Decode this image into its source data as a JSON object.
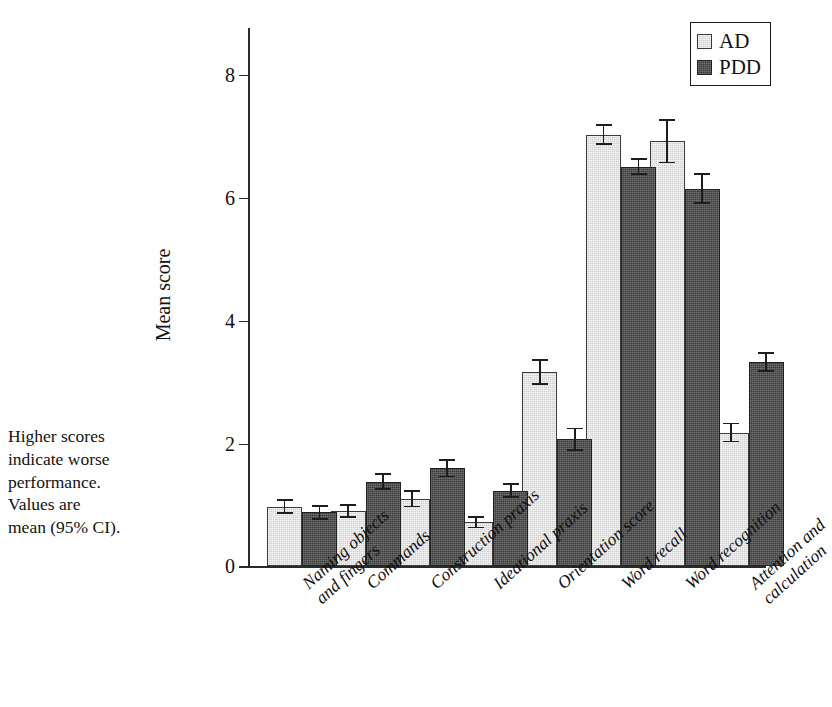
{
  "caption": {
    "lines": [
      "Higher scores",
      "indicate worse",
      "performance.",
      "Values are",
      "mean (95% CI)."
    ]
  },
  "legend": {
    "position": "top-right",
    "entries": [
      {
        "label": "AD",
        "color": "#cfcfcf"
      },
      {
        "label": "PDD",
        "color": "#3b3b3b"
      }
    ]
  },
  "axes": {
    "ylabel": "Mean score",
    "yticks": [
      "0",
      "2",
      "4",
      "6",
      "8"
    ]
  },
  "chart_data": {
    "type": "bar",
    "title": "",
    "xlabel": "",
    "ylabel": "Mean score",
    "ylim": [
      0,
      8.3
    ],
    "yticks": [
      0,
      2,
      4,
      6,
      8
    ],
    "grid": false,
    "legend_position": "top-right",
    "categories": [
      "Naming objects and fingers",
      "Commands",
      "Construction praxis",
      "Ideational praxis",
      "Orientation score",
      "Word recall",
      "Word recognition",
      "Attention and calculation"
    ],
    "category_lines": [
      [
        "Naming objects",
        "and fingers"
      ],
      [
        "Commands"
      ],
      [
        "Construction praxis"
      ],
      [
        "Ideational praxis"
      ],
      [
        "Orientation score"
      ],
      [
        "Word recall"
      ],
      [
        "Word recognition"
      ],
      [
        "Attention and",
        "calculation"
      ]
    ],
    "series": [
      {
        "name": "AD",
        "color": "#cfcfcf",
        "values": [
          0.97,
          0.9,
          1.1,
          0.72,
          3.17,
          7.03,
          6.92,
          2.18
        ],
        "ci_lower": [
          0.85,
          0.79,
          0.96,
          0.62,
          2.96,
          6.86,
          6.56,
          2.02
        ],
        "ci_upper": [
          1.09,
          1.01,
          1.24,
          0.82,
          3.38,
          7.2,
          7.28,
          2.34
        ]
      },
      {
        "name": "PDD",
        "color": "#3b3b3b",
        "values": [
          0.88,
          1.38,
          1.6,
          1.23,
          2.07,
          6.51,
          6.15,
          3.33
        ],
        "ci_lower": [
          0.76,
          1.24,
          1.45,
          1.11,
          1.88,
          6.37,
          5.9,
          3.17
        ],
        "ci_upper": [
          1.0,
          1.52,
          1.75,
          1.35,
          2.26,
          6.65,
          6.4,
          3.49
        ]
      }
    ]
  }
}
